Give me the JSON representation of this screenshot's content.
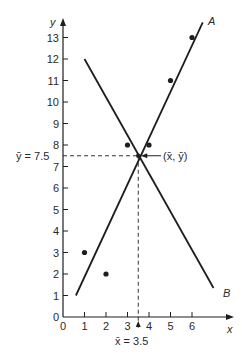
{
  "chart_data": {
    "type": "scatter",
    "title": "",
    "xlabel": "x",
    "ylabel": "y",
    "xlim": [
      0,
      7
    ],
    "ylim": [
      0,
      13.5
    ],
    "x_ticks": [
      "0",
      "1",
      "2",
      "3",
      "4",
      "5",
      "6"
    ],
    "y_ticks": [
      "0",
      "1",
      "2",
      "3",
      "4",
      "5",
      "6",
      "7",
      "8",
      "9",
      "10",
      "11",
      "12",
      "13"
    ],
    "grid": false,
    "points": [
      {
        "x": 1,
        "y": 3
      },
      {
        "x": 2,
        "y": 2
      },
      {
        "x": 3,
        "y": 8
      },
      {
        "x": 4,
        "y": 8
      },
      {
        "x": 5,
        "y": 11
      },
      {
        "x": 6,
        "y": 13
      }
    ],
    "lines": [
      {
        "name": "A",
        "x": [
          0.6,
          6.5
        ],
        "y": [
          1.0,
          13.7
        ]
      },
      {
        "name": "B",
        "x": [
          1.0,
          7.0
        ],
        "y": [
          12.0,
          1.35
        ]
      }
    ],
    "mean": {
      "x": 3.5,
      "y": 7.5
    },
    "annotations": {
      "mean_x_label": "x̄ = 3.5",
      "mean_y_label": "ȳ = 7.5",
      "mean_point_label": "(x̄, ȳ)",
      "line_a_label": "A",
      "line_b_label": "B"
    }
  }
}
